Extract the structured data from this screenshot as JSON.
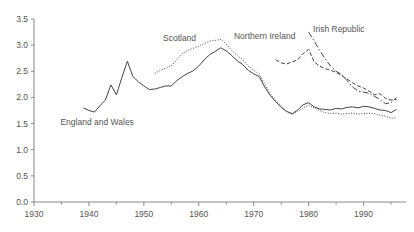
{
  "chart_data": {
    "type": "line",
    "title": "",
    "xlabel": "",
    "ylabel": "",
    "xlim": [
      1930,
      1997
    ],
    "ylim": [
      0.0,
      3.5
    ],
    "grid": false,
    "legend_position": "inline-labels",
    "x_ticks": [
      1930,
      1940,
      1950,
      1960,
      1970,
      1980,
      1990
    ],
    "x_minor_ticks": [
      1935,
      1945,
      1955,
      1965,
      1975,
      1985,
      1995
    ],
    "y_ticks": [
      0.0,
      0.5,
      1.0,
      1.5,
      2.0,
      2.5,
      3.0,
      3.5
    ],
    "y_tick_labels": [
      "0.0",
      "0.5",
      "1.0",
      "1.5",
      "2.0",
      "2.5",
      "3.0",
      "3.5"
    ],
    "x_tick_labels": [
      "1930",
      "1940",
      "1950",
      "1960",
      "1970",
      "1980",
      "1990"
    ],
    "series": [
      {
        "name": "England and Wales",
        "style": "solid",
        "label_x": 1941.5,
        "label_y": 1.47,
        "x": [
          1939,
          1940,
          1941,
          1942,
          1943,
          1944,
          1945,
          1946,
          1947,
          1948,
          1949,
          1950,
          1951,
          1952,
          1953,
          1954,
          1955,
          1956,
          1957,
          1958,
          1959,
          1960,
          1961,
          1962,
          1963,
          1964,
          1965,
          1966,
          1967,
          1968,
          1969,
          1970,
          1971,
          1972,
          1973,
          1974,
          1975,
          1976,
          1977,
          1978,
          1979,
          1980,
          1981,
          1982,
          1983,
          1984,
          1985,
          1986,
          1987,
          1988,
          1989,
          1990,
          1991,
          1992,
          1993,
          1994,
          1995,
          1996
        ],
        "y": [
          1.8,
          1.75,
          1.72,
          1.84,
          1.95,
          2.24,
          2.05,
          2.38,
          2.69,
          2.4,
          2.3,
          2.22,
          2.15,
          2.16,
          2.19,
          2.22,
          2.22,
          2.32,
          2.4,
          2.46,
          2.51,
          2.6,
          2.72,
          2.82,
          2.88,
          2.95,
          2.89,
          2.8,
          2.7,
          2.63,
          2.52,
          2.45,
          2.4,
          2.2,
          2.04,
          1.92,
          1.81,
          1.73,
          1.69,
          1.76,
          1.86,
          1.9,
          1.82,
          1.78,
          1.77,
          1.76,
          1.79,
          1.78,
          1.81,
          1.82,
          1.8,
          1.83,
          1.82,
          1.79,
          1.76,
          1.75,
          1.71,
          1.77
        ]
      },
      {
        "name": "Scotland",
        "style": "dotted",
        "label_x": 1956.5,
        "label_y": 3.08,
        "x": [
          1952,
          1953,
          1954,
          1955,
          1956,
          1957,
          1958,
          1959,
          1960,
          1961,
          1962,
          1963,
          1964,
          1965,
          1966,
          1967,
          1968,
          1969,
          1970,
          1971,
          1972,
          1973,
          1974,
          1975,
          1976,
          1977,
          1978,
          1979,
          1980,
          1981,
          1982,
          1983,
          1984,
          1985,
          1986,
          1987,
          1988,
          1989,
          1990,
          1991,
          1992,
          1993,
          1994,
          1995,
          1996
        ],
        "y": [
          2.46,
          2.52,
          2.56,
          2.6,
          2.72,
          2.84,
          2.9,
          2.94,
          2.98,
          3.03,
          3.08,
          3.09,
          3.11,
          3.02,
          2.9,
          2.8,
          2.72,
          2.6,
          2.52,
          2.45,
          2.26,
          2.07,
          1.94,
          1.84,
          1.74,
          1.67,
          1.73,
          1.8,
          1.85,
          1.8,
          1.75,
          1.71,
          1.69,
          1.7,
          1.68,
          1.69,
          1.7,
          1.68,
          1.69,
          1.7,
          1.69,
          1.66,
          1.64,
          1.6,
          1.61
        ]
      },
      {
        "name": "Northern Ireland",
        "style": "dashed",
        "label_x": 1972.0,
        "label_y": 3.12,
        "x": [
          1974,
          1975,
          1976,
          1977,
          1978,
          1979,
          1980,
          1981,
          1982,
          1983,
          1984,
          1985,
          1986,
          1987,
          1988,
          1989,
          1990,
          1991,
          1992,
          1993,
          1994,
          1995,
          1996
        ],
        "y": [
          2.72,
          2.66,
          2.64,
          2.68,
          2.72,
          2.84,
          2.92,
          2.68,
          2.6,
          2.55,
          2.52,
          2.48,
          2.42,
          2.35,
          2.28,
          2.22,
          2.18,
          2.12,
          2.05,
          2.07,
          1.98,
          1.95,
          1.96
        ]
      },
      {
        "name": "Irish Republic",
        "style": "dashdot",
        "label_x": 1985.5,
        "label_y": 3.26,
        "x": [
          1980,
          1981,
          1982,
          1983,
          1984,
          1985,
          1986,
          1987,
          1988,
          1989,
          1990,
          1991,
          1992,
          1993,
          1994,
          1995,
          1996
        ],
        "y": [
          3.25,
          3.08,
          2.9,
          2.74,
          2.6,
          2.5,
          2.44,
          2.32,
          2.2,
          2.12,
          2.1,
          2.08,
          2.02,
          1.96,
          1.88,
          1.9,
          2.0
        ]
      }
    ]
  },
  "axis": {
    "y_axis_name": "fertility-rate-axis",
    "x_axis_name": "year-axis"
  }
}
